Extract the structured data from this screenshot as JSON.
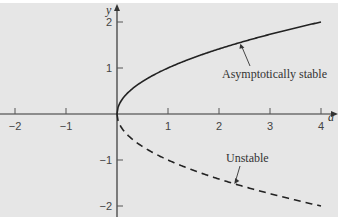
{
  "chart_data": {
    "type": "line",
    "title": "",
    "xlabel": "a",
    "ylabel": "y",
    "xlim": [
      -2.2,
      4.3
    ],
    "ylim": [
      -2.3,
      2.5
    ],
    "x_ticks": [
      -2,
      -1,
      1,
      2,
      3,
      4
    ],
    "x_tick_labels": [
      "−2",
      "−1",
      "1",
      "2",
      "3",
      "4"
    ],
    "y_ticks": [
      -2,
      -1,
      1,
      2
    ],
    "y_tick_labels": [
      "−2",
      "−1",
      "1",
      "2"
    ],
    "grid": false,
    "background": "#e6e6e6",
    "series": [
      {
        "name": "Asymptotically stable",
        "style": "solid",
        "function": "y = sqrt(a)",
        "x": [
          0,
          0.05,
          0.25,
          0.5,
          1,
          1.5,
          2,
          2.5,
          3,
          3.5,
          4
        ],
        "y": [
          0,
          0.224,
          0.5,
          0.707,
          1,
          1.225,
          1.414,
          1.581,
          1.732,
          1.871,
          2
        ]
      },
      {
        "name": "Unstable",
        "style": "dashed",
        "function": "y = -sqrt(a)",
        "x": [
          0,
          0.05,
          0.25,
          0.5,
          1,
          1.5,
          2,
          2.5,
          3,
          3.5,
          4
        ],
        "y": [
          0,
          -0.224,
          -0.5,
          -0.707,
          -1,
          -1.225,
          -1.414,
          -1.581,
          -1.732,
          -1.871,
          -2
        ]
      }
    ],
    "annotations": [
      {
        "text": "Asymptotically stable",
        "arrow_to": [
          2.4,
          1.55
        ]
      },
      {
        "text": "Unstable",
        "arrow_to": [
          2.3,
          -1.52
        ]
      }
    ]
  },
  "labels": {
    "x_axis": "a",
    "y_axis": "y",
    "stable": "Asymptotically stable",
    "unstable": "Unstable"
  }
}
